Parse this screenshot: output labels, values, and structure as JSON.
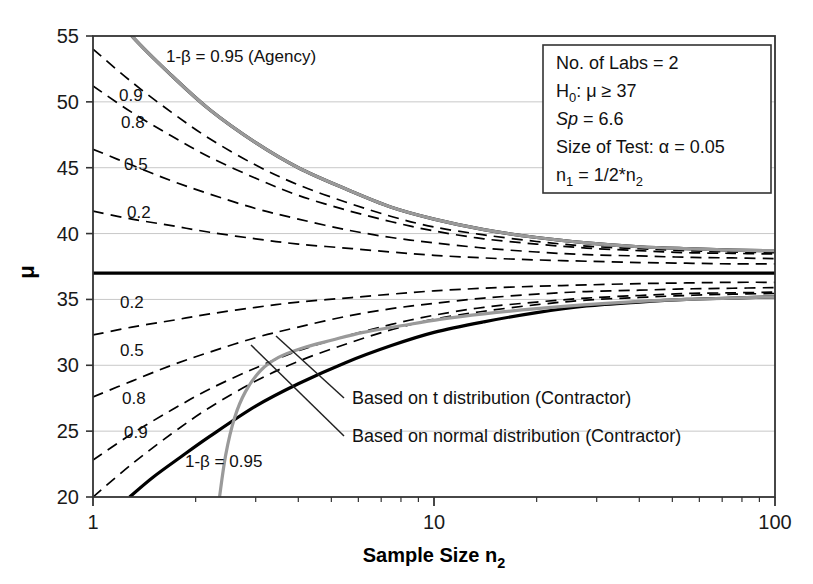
{
  "chart_data": {
    "type": "line",
    "title": "",
    "xlabel": "Sample Size n2",
    "ylabel": "μ",
    "xscale": "log",
    "xlim": [
      1,
      100
    ],
    "ylim": [
      20,
      55
    ],
    "xticks": [
      1,
      10,
      100
    ],
    "xtick_labels": [
      "1",
      "10",
      "100"
    ],
    "yticks": [
      20,
      25,
      30,
      35,
      40,
      45,
      50,
      55
    ],
    "ytick_labels": [
      "20",
      "25",
      "30",
      "35",
      "40",
      "45",
      "50",
      "55"
    ],
    "grid": "horizontal",
    "legend_position": "none",
    "null_hypothesis_line": 37,
    "series": [
      {
        "name": "upper-0.95-agency",
        "power": 0.95,
        "side": "upper",
        "style": "solid-bold",
        "color": "#000000",
        "x": [
          1,
          1.3,
          1.7,
          2.2,
          3,
          4,
          5.5,
          7.5,
          10,
          14,
          20,
          28,
          40,
          55,
          75,
          100
        ],
        "y": [
          58.6,
          55.0,
          52.0,
          49.4,
          46.9,
          45.0,
          43.4,
          42.0,
          41.1,
          40.3,
          39.7,
          39.3,
          39.0,
          38.85,
          38.75,
          38.7
        ]
      },
      {
        "name": "upper-0.9",
        "power": 0.9,
        "side": "upper",
        "style": "dashed",
        "color": "#000000",
        "x": [
          1,
          1.3,
          1.7,
          2.2,
          3,
          4,
          5.5,
          7.5,
          10,
          14,
          20,
          28,
          40,
          55,
          75,
          100
        ],
        "y": [
          54.0,
          51.5,
          49.2,
          47.2,
          45.2,
          43.7,
          42.4,
          41.3,
          40.5,
          39.9,
          39.4,
          39.05,
          38.85,
          38.7,
          38.6,
          38.55
        ]
      },
      {
        "name": "upper-0.8",
        "power": 0.8,
        "side": "upper",
        "style": "dashed",
        "color": "#000000",
        "x": [
          1,
          1.3,
          1.7,
          2.2,
          3,
          4,
          5.5,
          7.5,
          10,
          14,
          20,
          28,
          40,
          55,
          75,
          100
        ],
        "y": [
          51.2,
          49.2,
          47.4,
          45.8,
          44.2,
          42.9,
          41.8,
          40.9,
          40.2,
          39.6,
          39.2,
          38.9,
          38.7,
          38.55,
          38.5,
          38.45
        ]
      },
      {
        "name": "upper-0.5",
        "power": 0.5,
        "side": "upper",
        "style": "dashed",
        "color": "#000000",
        "x": [
          1,
          1.3,
          1.7,
          2.2,
          3,
          4,
          5.5,
          7.5,
          10,
          14,
          20,
          28,
          40,
          55,
          75,
          100
        ],
        "y": [
          46.4,
          45.2,
          44.0,
          43.0,
          41.9,
          41.1,
          40.3,
          39.7,
          39.3,
          38.9,
          38.6,
          38.4,
          38.3,
          38.2,
          38.15,
          38.1
        ]
      },
      {
        "name": "upper-0.2",
        "power": 0.2,
        "side": "upper",
        "style": "dashed",
        "color": "#000000",
        "x": [
          1,
          1.3,
          1.7,
          2.2,
          3,
          4,
          5.5,
          7.5,
          10,
          14,
          20,
          28,
          40,
          55,
          75,
          100
        ],
        "y": [
          41.7,
          41.1,
          40.6,
          40.1,
          39.6,
          39.2,
          38.9,
          38.6,
          38.35,
          38.15,
          38.0,
          37.9,
          37.8,
          37.75,
          37.7,
          37.7
        ]
      },
      {
        "name": "null-mean",
        "power": null,
        "side": "center",
        "style": "solid-bold",
        "color": "#000000",
        "x": [
          1,
          100
        ],
        "y": [
          37,
          37
        ]
      },
      {
        "name": "lower-0.2",
        "power": 0.2,
        "side": "lower",
        "style": "dashed",
        "color": "#000000",
        "x": [
          1,
          1.3,
          1.7,
          2.2,
          3,
          4,
          5.5,
          7.5,
          10,
          14,
          20,
          28,
          40,
          55,
          75,
          100
        ],
        "y": [
          32.3,
          32.9,
          33.4,
          33.9,
          34.4,
          34.8,
          35.1,
          35.4,
          35.65,
          35.85,
          36.0,
          36.1,
          36.2,
          36.25,
          36.3,
          36.3
        ]
      },
      {
        "name": "lower-0.5",
        "power": 0.5,
        "side": "lower",
        "style": "dashed",
        "color": "#000000",
        "x": [
          1,
          1.3,
          1.7,
          2.2,
          3,
          4,
          5.5,
          7.5,
          10,
          14,
          20,
          28,
          40,
          55,
          75,
          100
        ],
        "y": [
          27.6,
          28.8,
          30.0,
          31.0,
          32.1,
          32.9,
          33.7,
          34.3,
          34.7,
          35.1,
          35.4,
          35.6,
          35.7,
          35.8,
          35.85,
          35.9
        ]
      },
      {
        "name": "lower-0.8",
        "power": 0.8,
        "side": "lower",
        "style": "dashed",
        "color": "#000000",
        "x": [
          1,
          1.3,
          1.7,
          2.2,
          3,
          4,
          5.5,
          7.5,
          10,
          14,
          20,
          28,
          40,
          55,
          75,
          100
        ],
        "y": [
          22.8,
          24.8,
          26.6,
          28.2,
          29.8,
          31.1,
          32.2,
          33.1,
          33.8,
          34.4,
          34.8,
          35.1,
          35.3,
          35.45,
          35.5,
          35.55
        ]
      },
      {
        "name": "lower-0.9",
        "power": 0.9,
        "side": "lower",
        "style": "dashed",
        "color": "#000000",
        "x": [
          1,
          1.3,
          1.7,
          2.2,
          3,
          4,
          5.5,
          7.5,
          10,
          14,
          20,
          28,
          40,
          55,
          75,
          100
        ],
        "y": [
          20.0,
          22.5,
          24.8,
          26.8,
          28.8,
          30.3,
          31.6,
          32.7,
          33.5,
          34.1,
          34.6,
          34.95,
          35.15,
          35.3,
          35.4,
          35.45
        ]
      },
      {
        "name": "lower-0.95-agency",
        "power": 0.95,
        "side": "lower",
        "style": "solid-bold",
        "color": "#000000",
        "x": [
          1.28,
          1.5,
          1.8,
          2.2,
          3,
          4,
          5.5,
          7.5,
          10,
          14,
          20,
          28,
          40,
          55,
          75,
          100
        ],
        "y": [
          20.0,
          21.5,
          23.0,
          24.6,
          26.9,
          28.6,
          30.2,
          31.5,
          32.5,
          33.3,
          34.0,
          34.5,
          34.8,
          35.0,
          35.1,
          35.2
        ]
      },
      {
        "name": "normal-dist-contractor-upper",
        "power": 0.95,
        "side": "upper",
        "style": "solid-gray",
        "color": "#9a9a9a",
        "x": [
          1,
          1.3,
          1.7,
          2.2,
          3,
          4,
          5.5,
          7.5,
          10,
          14,
          20,
          28,
          40,
          55,
          75,
          100
        ],
        "y": [
          58.6,
          55.0,
          52.0,
          49.4,
          46.9,
          45.0,
          43.4,
          42.0,
          41.1,
          40.3,
          39.7,
          39.3,
          39.0,
          38.85,
          38.75,
          38.7
        ]
      },
      {
        "name": "normal-dist-contractor-lower",
        "power": 0.95,
        "side": "lower",
        "style": "solid-gray",
        "color": "#9a9a9a",
        "x": [
          2.35,
          2.45,
          2.6,
          2.8,
          3.1,
          3.5,
          4.1,
          5,
          6.2,
          8,
          10.5,
          14,
          20,
          28,
          40,
          55,
          75,
          100
        ],
        "y": [
          20.0,
          23.2,
          26.0,
          28.0,
          29.6,
          30.6,
          31.3,
          31.9,
          32.5,
          33.0,
          33.5,
          33.9,
          34.3,
          34.6,
          34.85,
          35.0,
          35.1,
          35.2
        ]
      }
    ],
    "curve_labels": [
      {
        "text": "1-β = 0.95 (Agency)",
        "x_px": 166,
        "y_px": 62,
        "name": "label-upper-095-agency"
      },
      {
        "text": "0.9",
        "x_px": 119,
        "y_px": 101,
        "name": "label-upper-09"
      },
      {
        "text": "0.8",
        "x_px": 121,
        "y_px": 128,
        "name": "label-upper-08"
      },
      {
        "text": "0.5",
        "x_px": 124,
        "y_px": 170,
        "name": "label-upper-05"
      },
      {
        "text": "0.2",
        "x_px": 127,
        "y_px": 218,
        "name": "label-upper-02"
      },
      {
        "text": "0.2",
        "x_px": 120,
        "y_px": 308,
        "name": "label-lower-02"
      },
      {
        "text": "0.5",
        "x_px": 120,
        "y_px": 356,
        "name": "label-lower-05"
      },
      {
        "text": "0.8",
        "x_px": 122,
        "y_px": 404,
        "name": "label-lower-08"
      },
      {
        "text": "0.9",
        "x_px": 124,
        "y_px": 438,
        "name": "label-lower-09"
      },
      {
        "text": "1-β = 0.95",
        "x_px": 185,
        "y_px": 467,
        "name": "label-lower-095"
      }
    ],
    "annotations": [
      {
        "text": "Based on t distribution (Contractor)",
        "x_px": 352,
        "y_px": 404,
        "leader": {
          "x1": 344,
          "y1": 398,
          "x2": 276,
          "y2": 336
        },
        "name": "annotation-t-distribution"
      },
      {
        "text": "Based on normal distribution (Contractor)",
        "x_px": 352,
        "y_px": 442,
        "leader": {
          "x1": 344,
          "y1": 436,
          "x2": 251,
          "y2": 345
        },
        "name": "annotation-normal-distribution"
      }
    ]
  },
  "legend_box": {
    "lines": [
      {
        "id": "labs",
        "text": "No. of Labs = 2"
      },
      {
        "id": "h0",
        "text": "H0: μ ≥ 37"
      },
      {
        "id": "sp",
        "text": "Sp = 6.6"
      },
      {
        "id": "alpha",
        "text": "Size of Test: α = 0.05"
      },
      {
        "id": "n1",
        "text": "n1 = 1/2*n2"
      }
    ]
  },
  "colors": {
    "axis": "#333333",
    "grid": "#c8c8c8",
    "curve": "#000000",
    "gray_curve": "#9a9a9a",
    "background": "#ffffff"
  }
}
